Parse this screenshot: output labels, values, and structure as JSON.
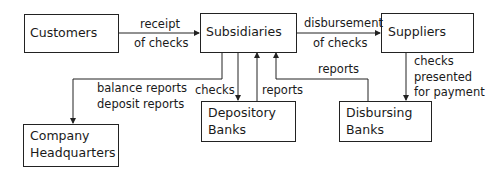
{
  "nodes": {
    "customers": {
      "label": "Customers"
    },
    "subsidiaries": {
      "label": "Subsidiaries"
    },
    "suppliers": {
      "label": "Suppliers"
    },
    "company_headquarters": {
      "line1": "Company",
      "line2": "Headquarters"
    },
    "depository_banks": {
      "line1": "Depository",
      "line2": "Banks"
    },
    "disbursing_banks": {
      "line1": "Disbursing",
      "line2": "Banks"
    }
  },
  "edges": {
    "customers_to_subsidiaries": {
      "line1": "receipt",
      "line2": "of checks"
    },
    "subsidiaries_to_suppliers": {
      "line1": "disbursement",
      "line2": "of checks"
    },
    "suppliers_to_disbursing": {
      "line1": "checks",
      "line2": "presented",
      "line3": "for payment"
    },
    "subsidiaries_to_hq": {
      "line1": "balance reports",
      "line2": "deposit reports"
    },
    "subsidiaries_to_depository": {
      "label": "checks"
    },
    "depository_to_subsidiaries": {
      "label": "reports"
    },
    "disbursing_to_subsidiaries": {
      "label": "reports"
    }
  }
}
